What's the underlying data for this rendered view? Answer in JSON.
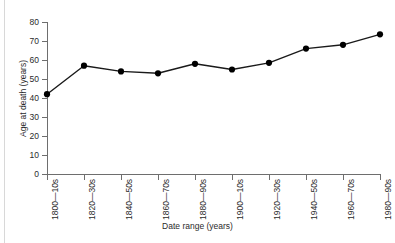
{
  "chart_data": {
    "type": "line",
    "title": "",
    "xlabel": "Date range (years)",
    "ylabel": "Age at death (years)",
    "categories": [
      "1800—10s",
      "1820—30s",
      "1840—50s",
      "1860—70s",
      "1880—90s",
      "1900—10s",
      "1920—30s",
      "1940—50s",
      "1960—70s",
      "1980—90s"
    ],
    "values": [
      42,
      57,
      54,
      53,
      58,
      55,
      58.5,
      66,
      68,
      73.5
    ],
    "ylim": [
      0,
      80
    ],
    "yticks": [
      0,
      10,
      20,
      30,
      40,
      50,
      60,
      70,
      80
    ],
    "ytick_labels": [
      "0",
      "10",
      "20",
      "30",
      "40",
      "50",
      "60",
      "70",
      "80"
    ],
    "grid": false,
    "legend": null,
    "marker": "filled-circle",
    "line_color": "#1a1a1a",
    "marker_color": "#000000",
    "axis_color": "#6e6e6e",
    "background_color": "#ffffff"
  }
}
